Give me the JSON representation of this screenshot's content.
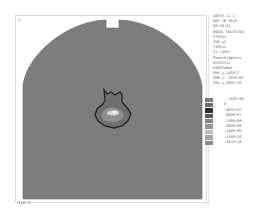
{
  "viewport": {
    "window_number": "1",
    "scale_label": "1|e-1"
  },
  "colors": {
    "body_fill": "#7d7d7d",
    "outline": "#2a2a2a",
    "hotspot_light": "#d8d8d8",
    "hotspot_mid": "#9a9a9a"
  },
  "legend": {
    "lines": [
      "ANSYS 12.1",
      "NOV 18 2010",
      "08:58:31",
      "NODAL SOLUTION",
      "STEP=1",
      "SUB =1",
      "TIME=1",
      "S1        (AVG)",
      "PowerGraphics",
      "EFACET=1",
      "AVRES=Mat",
      "DMX =.143972",
      "SMN =-.702E+09",
      "SMX =.201E+10"
    ],
    "contour_scale": [
      {
        "value": "-.702E+08",
        "color": "#7a7a7a"
      },
      {
        "value": "0",
        "color": "#6e6e6e"
      },
      {
        "value": ".603E+07",
        "color": "#2e2e2e"
      },
      {
        "value": ".603E+07",
        "color": "#5a5a5a"
      },
      {
        "value": ".150E+08",
        "color": "#858585"
      },
      {
        "value": ".300E+08",
        "color": "#959595"
      },
      {
        "value": ".150E+09",
        "color": "#bdbdbd"
      },
      {
        "value": ".150E+10",
        "color": "#a5a5a5"
      },
      {
        "value": ".347E+10",
        "color": "#8c8c8c"
      }
    ]
  }
}
